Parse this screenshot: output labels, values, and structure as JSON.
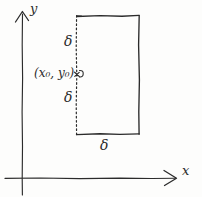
{
  "figure": {
    "type": "hand-drawn-diagram",
    "ink_color": "#2b2b2b",
    "background_color": "#fdfdfc"
  },
  "axes": {
    "y_axis": {
      "label": "y",
      "orientation": "vertical",
      "arrow": "up",
      "x_px": 22,
      "top_px": 12,
      "bottom_px": 195
    },
    "x_axis": {
      "label": "x",
      "orientation": "horizontal",
      "arrow": "right",
      "y_px": 178,
      "left_px": 5,
      "right_px": 176
    }
  },
  "rectangle": {
    "left_px": 76,
    "right_px": 139,
    "top_px": 16,
    "bottom_px": 134,
    "left_edge_style": "dotted",
    "top_edge_style": "solid",
    "right_edge_style": "solid",
    "bottom_edge_style": "solid",
    "fill": "none"
  },
  "point": {
    "label": "(x₀, y₀)",
    "x_px": 76,
    "y_px": 74,
    "marker": "dot"
  },
  "labels": {
    "delta_top": "δ",
    "delta_middle": "δ",
    "delta_bottom": "δ",
    "y_axis": "y",
    "x_axis": "x"
  }
}
